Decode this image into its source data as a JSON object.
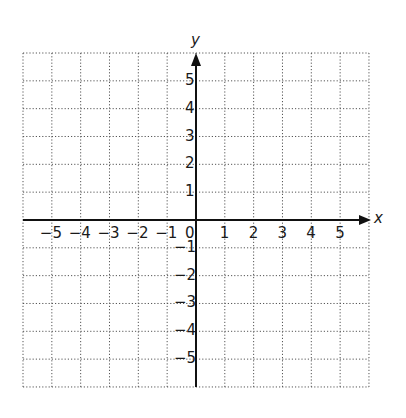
{
  "diagram": {
    "type": "coordinate-plane",
    "x_axis": {
      "label": "x",
      "min": -6,
      "max": 6,
      "tick_labels": [
        "−5",
        "−4",
        "−3",
        "−2",
        "−1",
        "1",
        "2",
        "3",
        "4",
        "5"
      ],
      "tick_values": [
        -5,
        -4,
        -3,
        -2,
        -1,
        1,
        2,
        3,
        4,
        5
      ]
    },
    "y_axis": {
      "label": "y",
      "min": -6,
      "max": 6,
      "tick_labels": [
        "5",
        "4",
        "3",
        "2",
        "1",
        "−1",
        "−2",
        "−3",
        "−4",
        "−5"
      ],
      "tick_values": [
        5,
        4,
        3,
        2,
        1,
        -1,
        -2,
        -3,
        -4,
        -5
      ]
    },
    "origin_label": "0",
    "grid": {
      "style": "dotted",
      "columns": 12,
      "rows": 12
    },
    "colors": {
      "axis": "#111111",
      "grid": "#555555",
      "text": "#1a1a1a",
      "background": "#ffffff"
    }
  }
}
